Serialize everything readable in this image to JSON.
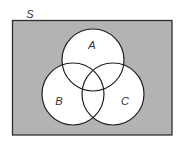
{
  "diagram": {
    "type": "venn",
    "universe": {
      "label": "S",
      "label_pos": {
        "x": 30,
        "y": 18
      },
      "rect": {
        "x": 12.5,
        "y": 20.5,
        "width": 159.5,
        "height": 114.5
      },
      "fill": "#b3b3b3",
      "stroke": "#2e2e2e"
    },
    "sets": [
      {
        "label": "A",
        "cx": 93,
        "cy": 60,
        "r": 31,
        "label_x": 92,
        "label_y": 49
      },
      {
        "label": "B",
        "cx": 73,
        "cy": 94,
        "r": 31,
        "label_x": 59,
        "label_y": 105
      },
      {
        "label": "C",
        "cx": 113,
        "cy": 94,
        "r": 31,
        "label_x": 125,
        "label_y": 105
      }
    ],
    "circle_fill": "#ffffff",
    "circle_stroke": "#1f1f1f"
  }
}
